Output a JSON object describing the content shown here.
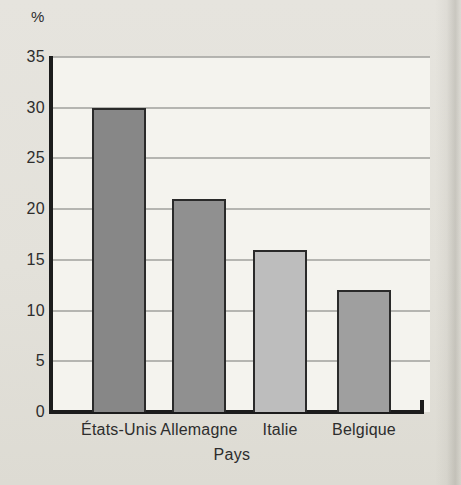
{
  "page": {
    "background_color": "#e3e1da",
    "plot_background_color": "#f4f3ee"
  },
  "chart_data": {
    "type": "bar",
    "title": "",
    "ylabel": "%",
    "xlabel": "Pays",
    "categories": [
      "États-Unis",
      "Allemagne",
      "Italie",
      "Belgique"
    ],
    "values": [
      30,
      21,
      16,
      12
    ],
    "ylim": [
      0,
      35
    ],
    "yticks": [
      0,
      5,
      10,
      15,
      20,
      25,
      30,
      35
    ],
    "grid": "horizontal",
    "legend": "none",
    "bar_colors": [
      "#878787",
      "#909090",
      "#bdbdbd",
      "#9f9f9f"
    ],
    "bar_border_color": "#2a2a2a",
    "axis_color": "#1c1c1c",
    "gridline_color": "#a9a9a6",
    "text_color": "#2d2d2d"
  }
}
